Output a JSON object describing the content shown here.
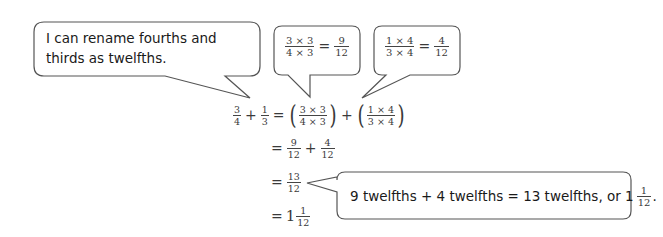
{
  "bubbles": {
    "rename": {
      "text": "I can rename fourths and thirds as twelfths."
    },
    "thirds_to_twelfths": {
      "lhs_num": "3 × 3",
      "lhs_den": "4 × 3",
      "eq": "=",
      "rhs_num": "9",
      "rhs_den": "12"
    },
    "fourths_to_twelfths": {
      "lhs_num": "1 × 4",
      "lhs_den": "3 × 4",
      "eq": "=",
      "rhs_num": "4",
      "rhs_den": "12"
    },
    "sum_words": {
      "text": "9 twelfths + 4 twelfths = 13 twelfths, or 1",
      "frac_num": "1",
      "frac_den": "12",
      "end": "."
    }
  },
  "equation": {
    "line1": {
      "a_num": "3",
      "a_den": "4",
      "plus": "+",
      "b_num": "1",
      "b_den": "3",
      "eq": "=",
      "lp1": "(",
      "c_num": "3 × 3",
      "c_den": "4 × 3",
      "rp1": ")",
      "plus2": "+",
      "lp2": "(",
      "d_num": "1 × 4",
      "d_den": "3 × 4",
      "rp2": ")"
    },
    "line2": {
      "eq": "=",
      "a_num": "9",
      "a_den": "12",
      "plus": "+",
      "b_num": "4",
      "b_den": "12"
    },
    "line3": {
      "eq": "=",
      "a_num": "13",
      "a_den": "12"
    },
    "line4": {
      "eq": "=",
      "whole": "1",
      "a_num": "1",
      "a_den": "12"
    }
  },
  "colors": {
    "stroke": "#555555",
    "text": "#1a1a1a"
  }
}
